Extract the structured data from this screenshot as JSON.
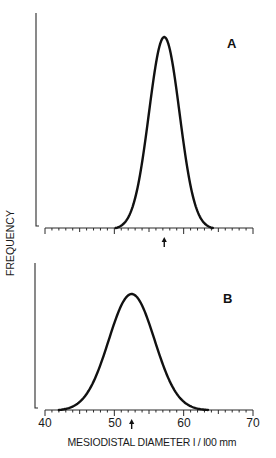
{
  "chart_data": {
    "type": "line",
    "xlabel": "MESIODISTAL DIAMETER  1/100 mm",
    "ylabel": "FREQUENCY",
    "xlim": [
      40,
      70
    ],
    "x_ticks": [
      40,
      50,
      60,
      70
    ],
    "x_tick_labels": [
      "40",
      "50",
      "60",
      "70"
    ],
    "minor_tick_step": 1,
    "grid": false,
    "legend": null,
    "panels": [
      {
        "label": "A",
        "distribution": "normal",
        "mean": 57.2,
        "sd": 2.2,
        "range": [
          50.2,
          64.2
        ],
        "marker_arrow_x": 57.2,
        "relative_peak_height": 1.0,
        "show_tick_labels": false,
        "x": [
          50,
          52,
          54,
          55,
          56,
          57,
          57.2,
          58,
          59,
          60,
          62,
          64
        ],
        "y": [
          0.0,
          0.08,
          0.35,
          0.58,
          0.86,
          0.99,
          1.0,
          0.94,
          0.72,
          0.44,
          0.1,
          0.0
        ]
      },
      {
        "label": "B",
        "distribution": "normal",
        "mean": 52.5,
        "sd": 3.3,
        "range": [
          42,
          63.5
        ],
        "marker_arrow_x": 52.5,
        "relative_peak_height": 0.78,
        "show_tick_labels": true,
        "x": [
          42,
          44,
          46,
          48,
          50,
          52,
          52.5,
          54,
          56,
          58,
          60,
          62,
          63.5
        ],
        "y": [
          0.0,
          0.06,
          0.2,
          0.42,
          0.67,
          0.77,
          0.78,
          0.71,
          0.52,
          0.3,
          0.12,
          0.02,
          0.0
        ]
      }
    ]
  },
  "labels": {
    "panel_a": "A",
    "panel_b": "B",
    "x_axis_title": "MESIODISTAL  DIAMETER   l / l00 mm",
    "y_axis_title": "FREQUENCY",
    "tick_40": "40",
    "tick_50": "50",
    "tick_60": "60",
    "tick_70": "70"
  }
}
